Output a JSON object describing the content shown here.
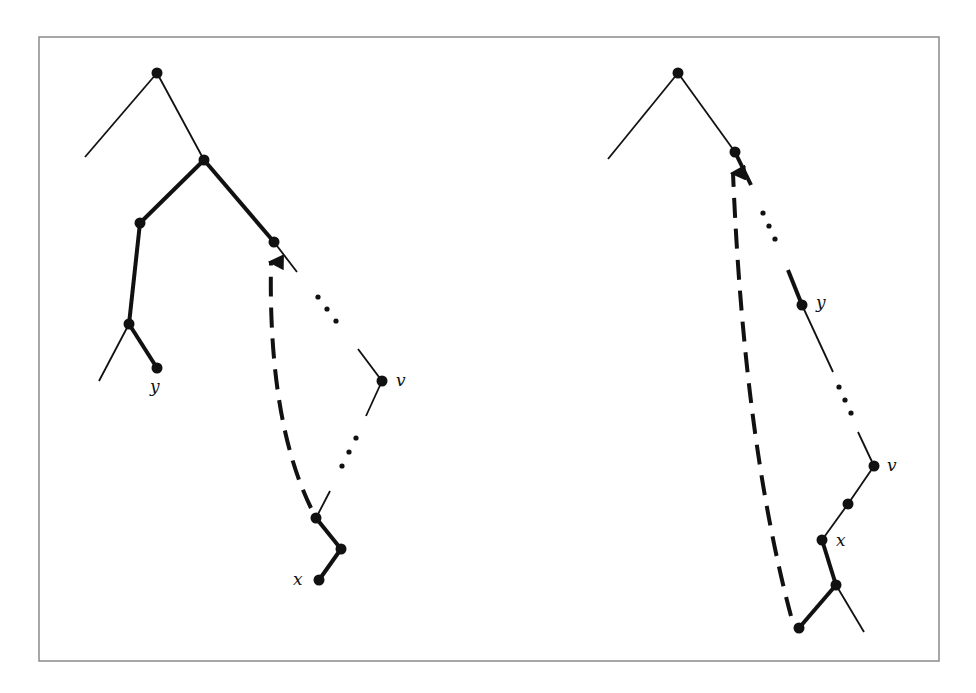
{
  "figure": {
    "frame": {
      "x": 39,
      "y": 37,
      "width": 900,
      "height": 624,
      "color": "#8a8a8a"
    },
    "ink_color": "#111111",
    "panels": [
      {
        "name": "left-tree",
        "labels": [
          {
            "id": "y",
            "text": "y",
            "x": 150,
            "y": 392
          },
          {
            "id": "v",
            "text": "v",
            "x": 396,
            "y": 386
          },
          {
            "id": "x",
            "text": "x",
            "x": 293,
            "y": 585
          }
        ],
        "nodes": [
          {
            "id": "root",
            "x": 157,
            "y": 73
          },
          {
            "id": "n1",
            "x": 204,
            "y": 160
          },
          {
            "id": "n2",
            "x": 140,
            "y": 223
          },
          {
            "id": "n3",
            "x": 274,
            "y": 242
          },
          {
            "id": "n4",
            "x": 129,
            "y": 324
          },
          {
            "id": "y",
            "x": 157,
            "y": 368
          },
          {
            "id": "v",
            "x": 382,
            "y": 381
          },
          {
            "id": "n5",
            "x": 316,
            "y": 518
          },
          {
            "id": "n6",
            "x": 341,
            "y": 549
          },
          {
            "id": "x",
            "x": 319,
            "y": 580
          }
        ]
      },
      {
        "name": "right-tree",
        "labels": [
          {
            "id": "y",
            "text": "y",
            "x": 816,
            "y": 308
          },
          {
            "id": "v",
            "text": "v",
            "x": 887,
            "y": 471
          },
          {
            "id": "x",
            "text": "x",
            "x": 836,
            "y": 546
          }
        ],
        "nodes": [
          {
            "id": "root",
            "x": 678,
            "y": 73
          },
          {
            "id": "n1",
            "x": 735,
            "y": 152
          },
          {
            "id": "y",
            "x": 802,
            "y": 305
          },
          {
            "id": "v",
            "x": 874,
            "y": 466
          },
          {
            "id": "n2",
            "x": 848,
            "y": 504
          },
          {
            "id": "x",
            "x": 822,
            "y": 540
          },
          {
            "id": "n3",
            "x": 836,
            "y": 585
          },
          {
            "id": "n4",
            "x": 799,
            "y": 628
          }
        ]
      }
    ]
  }
}
